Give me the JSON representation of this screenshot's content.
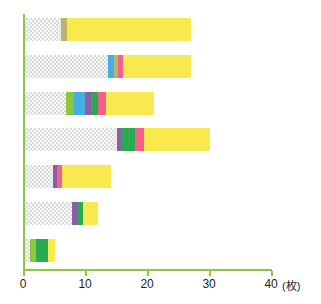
{
  "chart_data": {
    "type": "bar",
    "orientation": "horizontal",
    "stacked": true,
    "title": "",
    "xlabel": "(枚)",
    "ylabel": "",
    "xlim": [
      0,
      40
    ],
    "xticks": [
      0,
      10,
      20,
      30,
      40
    ],
    "xtick_labels": [
      "0",
      "10",
      "20",
      "30",
      "40"
    ],
    "grid": false,
    "legend": "none",
    "unit": "枚",
    "axis_color": "#8dc63f",
    "categories": [
      "bar-1",
      "bar-2",
      "bar-3",
      "bar-4",
      "bar-5",
      "bar-6",
      "bar-7"
    ],
    "totals": [
      27,
      27,
      21,
      30,
      14,
      12,
      5
    ],
    "series": [
      {
        "name": "gray",
        "color": "#d9d9d9",
        "values": [
          6.0,
          13.6,
          6.8,
          15.0,
          4.6,
          7.8,
          0.9
        ]
      },
      {
        "name": "light-green",
        "color": "#8dc63f",
        "values": [
          0,
          0,
          1.2,
          0,
          0,
          0,
          1.1
        ]
      },
      {
        "name": "blue",
        "color": "#47aee3",
        "values": [
          0,
          0.9,
          1.8,
          0,
          0,
          0,
          0
        ]
      },
      {
        "name": "olive",
        "color": "#bdb26b",
        "values": [
          0.9,
          0.6,
          0,
          0,
          0,
          0,
          0
        ]
      },
      {
        "name": "purple",
        "color": "#8b5ea8",
        "values": [
          0,
          0,
          1.0,
          0.7,
          0.8,
          0.9,
          0
        ]
      },
      {
        "name": "green",
        "color": "#2aab52",
        "values": [
          0,
          0,
          1.1,
          2.2,
          0,
          0.8,
          1.9
        ]
      },
      {
        "name": "pink",
        "color": "#f55f8d",
        "values": [
          0,
          0.9,
          1.3,
          1.5,
          0.8,
          0,
          0
        ]
      },
      {
        "name": "yellow",
        "color": "#f9e94e",
        "values": [
          20.1,
          11.0,
          7.8,
          10.6,
          7.8,
          2.5,
          1.1
        ]
      }
    ],
    "bars": [
      {
        "name": "bar-1",
        "total": 27,
        "segments": [
          {
            "series": "gray",
            "value": 6.0
          },
          {
            "series": "olive",
            "value": 0.9
          },
          {
            "series": "yellow",
            "value": 20.1
          }
        ]
      },
      {
        "name": "bar-2",
        "total": 27,
        "segments": [
          {
            "series": "gray",
            "value": 13.6
          },
          {
            "series": "blue",
            "value": 0.9
          },
          {
            "series": "olive",
            "value": 0.6
          },
          {
            "series": "pink",
            "value": 0.9
          },
          {
            "series": "yellow",
            "value": 11.0
          }
        ]
      },
      {
        "name": "bar-3",
        "total": 21,
        "segments": [
          {
            "series": "gray",
            "value": 6.8
          },
          {
            "series": "light-green",
            "value": 1.2
          },
          {
            "series": "blue",
            "value": 1.8
          },
          {
            "series": "purple",
            "value": 1.0
          },
          {
            "series": "green",
            "value": 1.1
          },
          {
            "series": "pink",
            "value": 1.3
          },
          {
            "series": "yellow",
            "value": 7.8
          }
        ]
      },
      {
        "name": "bar-4",
        "total": 30,
        "segments": [
          {
            "series": "gray",
            "value": 15.0
          },
          {
            "series": "purple",
            "value": 0.7
          },
          {
            "series": "green",
            "value": 2.2
          },
          {
            "series": "pink",
            "value": 1.5
          },
          {
            "series": "yellow",
            "value": 10.6
          }
        ]
      },
      {
        "name": "bar-5",
        "total": 14,
        "segments": [
          {
            "series": "gray",
            "value": 4.6
          },
          {
            "series": "purple",
            "value": 0.8
          },
          {
            "series": "pink",
            "value": 0.8
          },
          {
            "series": "yellow",
            "value": 7.8
          }
        ]
      },
      {
        "name": "bar-6",
        "total": 12,
        "segments": [
          {
            "series": "gray",
            "value": 7.8
          },
          {
            "series": "purple",
            "value": 0.9
          },
          {
            "series": "green",
            "value": 0.8
          },
          {
            "series": "yellow",
            "value": 2.5
          }
        ]
      },
      {
        "name": "bar-7",
        "total": 5,
        "segments": [
          {
            "series": "gray",
            "value": 0.9
          },
          {
            "series": "light-green",
            "value": 1.1
          },
          {
            "series": "green",
            "value": 1.9
          },
          {
            "series": "yellow",
            "value": 1.1
          }
        ]
      }
    ]
  }
}
